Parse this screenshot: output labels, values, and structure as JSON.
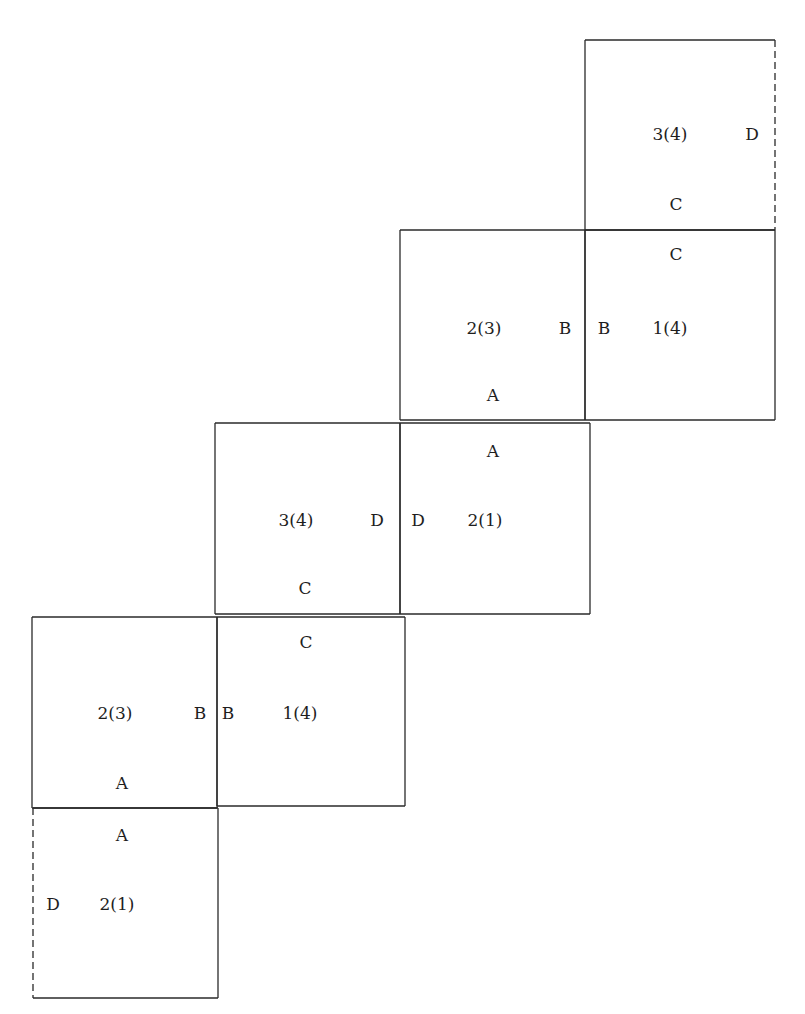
{
  "diagram": {
    "line_color": "#2a2a2a",
    "squares": [
      {
        "id": "sq-top",
        "x": 585,
        "y": 40,
        "w": 190,
        "h": 190,
        "dashed_edge": "right"
      },
      {
        "id": "sq-r2-left",
        "x": 400,
        "y": 230,
        "w": 185,
        "h": 190,
        "dashed_edge": null
      },
      {
        "id": "sq-r2-right",
        "x": 585,
        "y": 230,
        "w": 190,
        "h": 190,
        "dashed_edge": null
      },
      {
        "id": "sq-r3-left",
        "x": 215,
        "y": 423,
        "w": 185,
        "h": 191,
        "dashed_edge": null
      },
      {
        "id": "sq-r3-right",
        "x": 400,
        "y": 423,
        "w": 190,
        "h": 191,
        "dashed_edge": null
      },
      {
        "id": "sq-r4-left",
        "x": 32,
        "y": 617,
        "w": 185,
        "h": 191,
        "dashed_edge": null
      },
      {
        "id": "sq-r4-right",
        "x": 217,
        "y": 617,
        "w": 188,
        "h": 189,
        "dashed_edge": null
      },
      {
        "id": "sq-bottom",
        "x": 33,
        "y": 808,
        "w": 185,
        "h": 190,
        "dashed_edge": "left"
      }
    ],
    "labels": [
      {
        "text": "3(4)",
        "x": 670,
        "y": 134
      },
      {
        "text": "D",
        "x": 752,
        "y": 134
      },
      {
        "text": "C",
        "x": 676,
        "y": 204
      },
      {
        "text": "C",
        "x": 676,
        "y": 254
      },
      {
        "text": "2(3)",
        "x": 484,
        "y": 328
      },
      {
        "text": "B",
        "x": 565,
        "y": 328
      },
      {
        "text": "B",
        "x": 604,
        "y": 328
      },
      {
        "text": "1(4)",
        "x": 670,
        "y": 328
      },
      {
        "text": "A",
        "x": 493,
        "y": 395
      },
      {
        "text": "A",
        "x": 493,
        "y": 451
      },
      {
        "text": "3(4)",
        "x": 296,
        "y": 520
      },
      {
        "text": "D",
        "x": 377,
        "y": 520
      },
      {
        "text": "D",
        "x": 418,
        "y": 520
      },
      {
        "text": "2(1)",
        "x": 485,
        "y": 520
      },
      {
        "text": "C",
        "x": 305,
        "y": 588
      },
      {
        "text": "C",
        "x": 306,
        "y": 642
      },
      {
        "text": "2(3)",
        "x": 115,
        "y": 713
      },
      {
        "text": "B",
        "x": 200,
        "y": 713
      },
      {
        "text": "B",
        "x": 228,
        "y": 713
      },
      {
        "text": "1(4)",
        "x": 300,
        "y": 713
      },
      {
        "text": "A",
        "x": 122,
        "y": 783
      },
      {
        "text": "A",
        "x": 122,
        "y": 835
      },
      {
        "text": "D",
        "x": 53,
        "y": 904
      },
      {
        "text": "2(1)",
        "x": 117,
        "y": 904
      }
    ]
  }
}
